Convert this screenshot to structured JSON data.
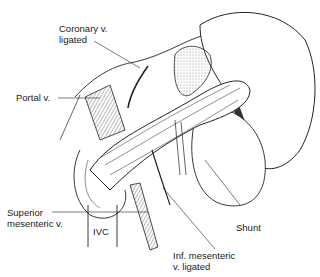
{
  "figure": {
    "labels": {
      "coronary_line1": "Coronary v.",
      "coronary_line2": "ligated",
      "portal": "Portal v.",
      "superior_line1": "Superior",
      "superior_line2": "mesenteric v.",
      "ivc": "IVC",
      "shunt": "Shunt",
      "inf_line1": "Inf. mesenteric",
      "inf_line2": "v. ligated"
    },
    "colors": {
      "ink": "#1a1a1a",
      "background": "#ffffff",
      "shade": "#8a8a8a"
    }
  }
}
